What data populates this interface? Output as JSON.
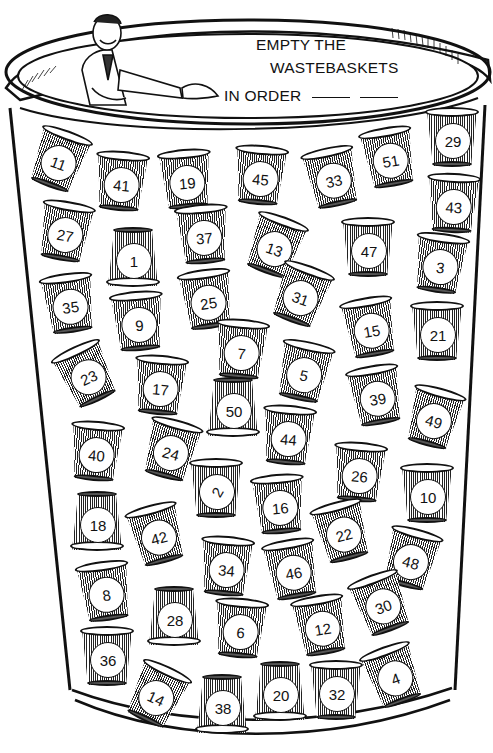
{
  "puzzle": {
    "title_line1": "EMPTY THE",
    "title_line2": "WASTEBASKETS",
    "title_line3": "IN ORDER",
    "answer_blanks": 2
  },
  "cups": [
    {
      "n": "11",
      "x": 30,
      "y": 128,
      "r": 20,
      "flip": false
    },
    {
      "n": "41",
      "x": 92,
      "y": 150,
      "r": 5,
      "flip": false
    },
    {
      "n": "19",
      "x": 157,
      "y": 148,
      "r": -5,
      "flip": false
    },
    {
      "n": "45",
      "x": 231,
      "y": 144,
      "r": 5,
      "flip": false
    },
    {
      "n": "33",
      "x": 303,
      "y": 146,
      "r": -12,
      "flip": false
    },
    {
      "n": "51",
      "x": 360,
      "y": 126,
      "r": -10,
      "flip": false
    },
    {
      "n": "29",
      "x": 423,
      "y": 106,
      "r": 0,
      "flip": false
    },
    {
      "n": "43",
      "x": 424,
      "y": 172,
      "r": 3,
      "flip": false
    },
    {
      "n": "27",
      "x": 36,
      "y": 200,
      "r": 10,
      "flip": false
    },
    {
      "n": "1",
      "x": 104,
      "y": 226,
      "r": 0,
      "flip": true
    },
    {
      "n": "37",
      "x": 174,
      "y": 203,
      "r": -5,
      "flip": false
    },
    {
      "n": "13",
      "x": 246,
      "y": 214,
      "r": 20,
      "flip": false
    },
    {
      "n": "47",
      "x": 339,
      "y": 216,
      "r": 0,
      "flip": false
    },
    {
      "n": "3",
      "x": 411,
      "y": 232,
      "r": 8,
      "flip": false
    },
    {
      "n": "35",
      "x": 40,
      "y": 272,
      "r": -8,
      "flip": false
    },
    {
      "n": "9",
      "x": 109,
      "y": 290,
      "r": -5,
      "flip": false
    },
    {
      "n": "25",
      "x": 178,
      "y": 268,
      "r": -8,
      "flip": false
    },
    {
      "n": "31",
      "x": 272,
      "y": 263,
      "r": 20,
      "flip": false
    },
    {
      "n": "15",
      "x": 341,
      "y": 296,
      "r": -10,
      "flip": false
    },
    {
      "n": "21",
      "x": 408,
      "y": 300,
      "r": 0,
      "flip": false
    },
    {
      "n": "7",
      "x": 212,
      "y": 318,
      "r": 5,
      "flip": false
    },
    {
      "n": "5",
      "x": 275,
      "y": 340,
      "r": 12,
      "flip": false
    },
    {
      "n": "23",
      "x": 57,
      "y": 343,
      "r": -25,
      "flip": false
    },
    {
      "n": "17",
      "x": 131,
      "y": 354,
      "r": 5,
      "flip": false
    },
    {
      "n": "50",
      "x": 204,
      "y": 376,
      "r": 0,
      "flip": true
    },
    {
      "n": "39",
      "x": 347,
      "y": 364,
      "r": -10,
      "flip": false
    },
    {
      "n": "49",
      "x": 405,
      "y": 386,
      "r": 15,
      "flip": false
    },
    {
      "n": "40",
      "x": 67,
      "y": 420,
      "r": 5,
      "flip": false
    },
    {
      "n": "24",
      "x": 142,
      "y": 418,
      "r": 15,
      "flip": false
    },
    {
      "n": "44",
      "x": 259,
      "y": 404,
      "r": 5,
      "flip": false
    },
    {
      "n": "26",
      "x": 330,
      "y": 441,
      "r": 5,
      "flip": false
    },
    {
      "n": "2",
      "x": 187,
      "y": 457,
      "r": 0,
      "flip": false
    },
    {
      "n": "16",
      "x": 250,
      "y": 473,
      "r": -5,
      "flip": false
    },
    {
      "n": "10",
      "x": 398,
      "y": 462,
      "r": 0,
      "flip": false
    },
    {
      "n": "18",
      "x": 68,
      "y": 490,
      "r": 0,
      "flip": true
    },
    {
      "n": "42",
      "x": 128,
      "y": 503,
      "r": -15,
      "flip": false
    },
    {
      "n": "22",
      "x": 313,
      "y": 500,
      "r": -15,
      "flip": false
    },
    {
      "n": "34",
      "x": 197,
      "y": 535,
      "r": 5,
      "flip": false
    },
    {
      "n": "46",
      "x": 263,
      "y": 538,
      "r": -10,
      "flip": false
    },
    {
      "n": "48",
      "x": 382,
      "y": 527,
      "r": 15,
      "flip": false
    },
    {
      "n": "8",
      "x": 76,
      "y": 560,
      "r": -8,
      "flip": false
    },
    {
      "n": "30",
      "x": 352,
      "y": 572,
      "r": -20,
      "flip": false
    },
    {
      "n": "28",
      "x": 145,
      "y": 585,
      "r": 0,
      "flip": true
    },
    {
      "n": "6",
      "x": 211,
      "y": 597,
      "r": 5,
      "flip": false
    },
    {
      "n": "12",
      "x": 292,
      "y": 594,
      "r": -10,
      "flip": false
    },
    {
      "n": "36",
      "x": 78,
      "y": 625,
      "r": 0,
      "flip": false
    },
    {
      "n": "14",
      "x": 128,
      "y": 663,
      "r": 25,
      "flip": false
    },
    {
      "n": "38",
      "x": 193,
      "y": 673,
      "r": 0,
      "flip": true
    },
    {
      "n": "20",
      "x": 251,
      "y": 660,
      "r": 0,
      "flip": true
    },
    {
      "n": "32",
      "x": 307,
      "y": 659,
      "r": 0,
      "flip": false
    },
    {
      "n": "4",
      "x": 364,
      "y": 644,
      "r": -20,
      "flip": false
    }
  ]
}
